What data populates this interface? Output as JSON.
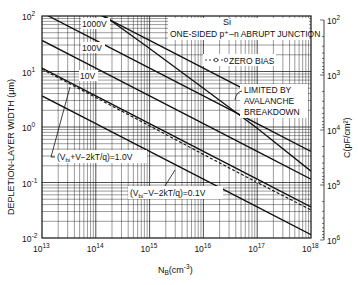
{
  "chart_data": {
    "type": "line",
    "title_line1": "Si",
    "title_line2": "ONE-SIDED p⁺–n ABRUPT JUNCTION",
    "xlabel": "N_B (cm^-3)",
    "xlabel_main": "N",
    "xlabel_sub": "B",
    "xlabel_unit": "(cm",
    "xlabel_exp": "-3",
    "xlabel_close": ")",
    "ylabel": "DEPLETION-LAYER WIDTH (μm)",
    "ylabel_right": "C(pF/cm²)",
    "xscale": "log",
    "yscale": "log",
    "xlim": [
      10000000000000.0,
      1e+18
    ],
    "ylim": [
      0.01,
      100
    ],
    "y2lim": [
      100,
      1000000
    ],
    "grid": true,
    "x_ticks": [
      {
        "base": "10",
        "exp": "13"
      },
      {
        "base": "10",
        "exp": "14"
      },
      {
        "base": "10",
        "exp": "15"
      },
      {
        "base": "10",
        "exp": "16"
      },
      {
        "base": "10",
        "exp": "17"
      },
      {
        "base": "10",
        "exp": "18"
      }
    ],
    "y_ticks": [
      {
        "base": "10",
        "exp": "2"
      },
      {
        "base": "10",
        "exp": "1"
      },
      {
        "base": "10",
        "exp": "0"
      },
      {
        "base": "10",
        "exp": "-1"
      },
      {
        "base": "10",
        "exp": "-2"
      }
    ],
    "y2_ticks": [
      {
        "base": "10",
        "exp": "2"
      },
      {
        "base": "10",
        "exp": "3"
      },
      {
        "base": "10",
        "exp": "4"
      },
      {
        "base": "10",
        "exp": "5"
      },
      {
        "base": "10",
        "exp": "6"
      }
    ],
    "x": [
      10000000000000.0,
      100000000000000.0,
      1000000000000000.0,
      1e+16,
      1e+17,
      1e+18
    ],
    "series": [
      {
        "name": "1000V",
        "label": "1000V",
        "values": [
          363,
          115,
          36.3,
          11.5,
          3.63,
          null
        ]
      },
      {
        "name": "100V",
        "label": "100V",
        "values": [
          115,
          36.3,
          11.5,
          3.63,
          1.15,
          0.363
        ]
      },
      {
        "name": "10V",
        "label": "10V",
        "values": [
          36.3,
          11.5,
          3.63,
          1.15,
          0.363,
          0.115
        ]
      },
      {
        "name": "(Vbi+V-2kT/q)=1.0V",
        "label": "(V_bi+V-2kT/q)=1.0V",
        "values": [
          11.5,
          3.63,
          1.15,
          0.363,
          0.115,
          0.0363
        ]
      },
      {
        "name": "ZERO BIAS",
        "label": "ZERO BIAS",
        "values": [
          11.0,
          3.4,
          1.05,
          0.32,
          0.1,
          0.032
        ]
      },
      {
        "name": "(Vbi-V-2kT/q)=0.1V",
        "label": "(V_bi-V-2kT/q)=0.1V",
        "values": [
          3.63,
          1.15,
          0.363,
          0.115,
          0.0363,
          0.0115
        ]
      },
      {
        "name": "LIMITED BY AVALANCHE BREAKDOWN",
        "label": "LIMITED BY AVALANCHE BREAKDOWN",
        "values": [
          null,
          80,
          18,
          3.6,
          0.7,
          0.12
        ]
      }
    ],
    "annotations": {
      "v1000": "1000V",
      "v100": "100V",
      "v10": "10V",
      "zero_bias": "ZERO BIAS",
      "breakdown_1": "LIMITED BY",
      "breakdown_2": "AVALANCHE",
      "breakdown_3": "BREAKDOWN",
      "v1_pre": "(V",
      "v1_sub": "bi",
      "v1_post": "+V−2kT/q)=1.0V",
      "v01_pre": "(V",
      "v01_sub": "bi",
      "v01_post": "−V−2kT/q)=0.1V"
    }
  }
}
